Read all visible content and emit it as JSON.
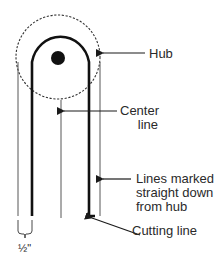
{
  "diagram": {
    "labels": {
      "hub": "Hub",
      "center_line": "Center\nline",
      "lines_marked": "Lines marked\nstraight down\nfrom hub",
      "cutting_line": "Cutting line",
      "width_dimension": "½\""
    },
    "colors": {
      "stroke": "#1a1a1a",
      "thin_stroke": "#444444",
      "text": "#2a2a2a",
      "background": "#ffffff"
    },
    "geometry": {
      "hub_circle": {
        "cx": 58,
        "cy": 57,
        "r": 42,
        "style": "dashed"
      },
      "hub_dot": {
        "cx": 58,
        "cy": 58,
        "r": 7
      },
      "cutting_line_u": {
        "left_x": 32,
        "right_x": 89,
        "arc_cy": 60,
        "arc_r": 29,
        "bottom_y": 216
      },
      "outer_lines": {
        "left_x": 18,
        "right_x": 100,
        "top_y": 62,
        "bottom_y": 216
      },
      "center_line": {
        "x": 61,
        "top_y": 100,
        "bottom_y": 218
      }
    }
  }
}
